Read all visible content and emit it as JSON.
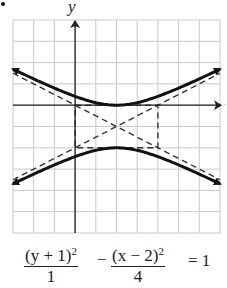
{
  "figure": {
    "y_axis_label": "y",
    "x_axis_label": "x",
    "bullet": "•",
    "grid": {
      "xmin": -3,
      "xmax": 7,
      "ymin": -6,
      "ymax": 4,
      "step": 1
    },
    "colors": {
      "grid": "#c8c8c8",
      "curve": "#111111",
      "axis": "#222222",
      "dashed": "#333333"
    }
  },
  "equation": {
    "term1_num": "(y + 1)",
    "term1_exp": "2",
    "term1_den": "1",
    "minus": "−",
    "term2_num": "(x − 2)",
    "term2_exp": "2",
    "term2_den": "4",
    "rhs": "= 1"
  },
  "chart_data": {
    "type": "line",
    "title": "",
    "equation": "(y+1)^2/1 - (x-2)^2/4 = 1",
    "xlabel": "x",
    "ylabel": "y",
    "xlim": [
      -3,
      7
    ],
    "ylim": [
      -6,
      4
    ],
    "grid": true,
    "center": [
      2,
      -1
    ],
    "vertices": [
      [
        2,
        0
      ],
      [
        2,
        -2
      ]
    ],
    "fundamental_rectangle": {
      "x": [
        0,
        4
      ],
      "y": [
        -2,
        0
      ]
    },
    "asymptotes": [
      "y + 1 = (x - 2)/2",
      "y + 1 = -(x - 2)/2"
    ],
    "series": [
      {
        "name": "upper branch",
        "style": "solid",
        "x": [
          -3,
          -2,
          -1,
          0,
          1,
          2,
          3,
          4,
          5,
          6,
          7
        ],
        "y": [
          1.69,
          1.24,
          0.8,
          0.41,
          0.12,
          0,
          0.12,
          0.41,
          0.8,
          1.24,
          1.69
        ]
      },
      {
        "name": "lower branch",
        "style": "solid",
        "x": [
          -3,
          -2,
          -1,
          0,
          1,
          2,
          3,
          4,
          5,
          6,
          7
        ],
        "y": [
          -3.69,
          -3.24,
          -2.8,
          -2.41,
          -2.12,
          -2,
          -2.12,
          -2.41,
          -2.8,
          -3.24,
          -3.69
        ]
      }
    ]
  }
}
